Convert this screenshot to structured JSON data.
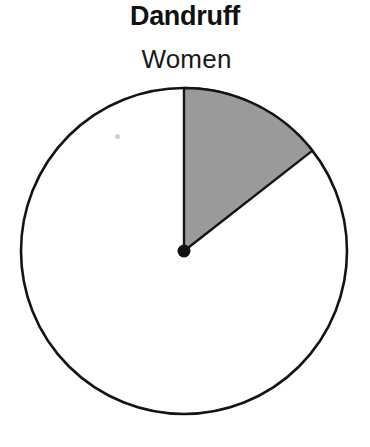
{
  "chart_data": {
    "type": "pie",
    "title": "Dandruff",
    "labels": [
      "Women",
      ""
    ],
    "values": [
      14.4,
      85.6
    ],
    "slice_colors": [
      "#9a9a9a",
      "#ffffff"
    ],
    "annotations": [
      "Women"
    ],
    "legend": "none",
    "grid": false,
    "xlabel": "",
    "ylabel": "",
    "start_angle_deg": 0,
    "direction": "clockwise",
    "geometry": {
      "center_x": 184,
      "center_y": 251,
      "radius": 163,
      "sector_start_deg": 0,
      "sector_end_deg": 52,
      "outline_color": "#141414",
      "outline_width": 2.6,
      "center_dot_radius": 6.5,
      "center_dot_color": "#101010"
    }
  },
  "figure": {
    "title": "Dandruff",
    "slice_label": "Women",
    "background_color": "#ffffff"
  }
}
